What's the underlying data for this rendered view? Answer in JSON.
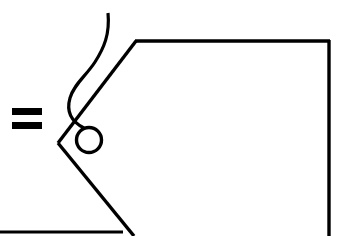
{
  "document": {
    "title": "Line drawing figure",
    "background_color": "#ffffff",
    "ink_color": "#000000",
    "width": 343,
    "height": 236
  },
  "figure": {
    "caption_symbol": "=",
    "symbol_name": "equals-sign",
    "line_width": 3,
    "elements": [
      {
        "name": "equals-sign-upper-bar",
        "type": "rect",
        "x": 12,
        "y": 108,
        "width": 30,
        "height": 7
      },
      {
        "name": "equals-sign-lower-bar",
        "type": "rect",
        "x": 12,
        "y": 122,
        "width": 30,
        "height": 7
      },
      {
        "name": "upper-diagonal-edge",
        "type": "line",
        "points": "58,143 136,41"
      },
      {
        "name": "top-horizontal-edge",
        "type": "line",
        "points": "135,41 330,41"
      },
      {
        "name": "right-vertical-edge",
        "type": "line",
        "points": "329,40 329,236"
      },
      {
        "name": "lower-diagonal-edge",
        "type": "line",
        "points": "58,143 134,236"
      },
      {
        "name": "bottom-horizontal-edge",
        "type": "line",
        "points": "0,232 123,232"
      },
      {
        "name": "wavy-curve",
        "type": "path",
        "d": "M108,13 C110,34 104,48 95,62 C86,76 74,84 70,98 C66,112 72,122 84,128"
      },
      {
        "name": "small-circle",
        "type": "circle",
        "cx": 89,
        "cy": 140,
        "r": 12.5
      }
    ]
  }
}
